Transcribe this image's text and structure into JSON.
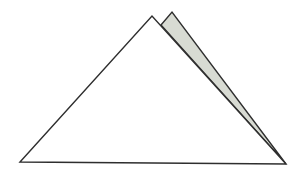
{
  "diagram": {
    "colors": {
      "background": "#ffffff",
      "stroke": "#2e2e2e",
      "main_fill": "#ffffff",
      "flap_fill": "#d8dbd3"
    },
    "shapes": {
      "main_triangle": {
        "points": [
          [
            20,
            162
          ],
          [
            152,
            16
          ],
          [
            286,
            164
          ]
        ]
      },
      "back_flap": {
        "points": [
          [
            161,
            25
          ],
          [
            172,
            12
          ],
          [
            286,
            164
          ]
        ]
      }
    }
  }
}
